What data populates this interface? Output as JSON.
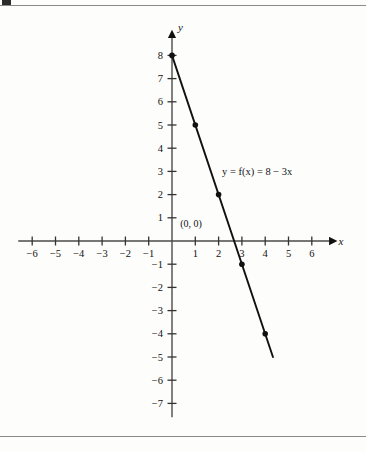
{
  "page": {
    "top_rule": true,
    "bottom_rule": true,
    "background": "#fdfdfc",
    "ink_color": "#111111"
  },
  "chart_data": {
    "type": "line",
    "title": "",
    "xlabel": "x",
    "ylabel": "y",
    "equation_label": "y = f(x) = 8 − 3x",
    "origin_label": "(0, 0)",
    "xlim": [
      -6.6,
      6.8
    ],
    "ylim": [
      -7.6,
      8.8
    ],
    "grid": false,
    "legend": "none",
    "x_ticks": [
      -6,
      -5,
      -4,
      -3,
      -2,
      -1,
      1,
      2,
      3,
      4,
      5,
      6
    ],
    "x_tick_labels": [
      "−6",
      "−5",
      "−4",
      "−3",
      "−2",
      "−1",
      "1",
      "2",
      "3",
      "4",
      "5",
      "6"
    ],
    "y_ticks": [
      8,
      7,
      6,
      5,
      4,
      3,
      2,
      1,
      -1,
      -2,
      -3,
      -4,
      -5,
      -6,
      -7
    ],
    "y_tick_labels": [
      "8",
      "7",
      "6",
      "5",
      "4",
      "3",
      "2",
      "1",
      "−1",
      "−2",
      "−3",
      "−4",
      "−5",
      "−6",
      "−7"
    ],
    "series": [
      {
        "name": "f(x) = 8 - 3x",
        "line_from": [
          0,
          8
        ],
        "line_to": [
          4.333,
          -5
        ],
        "points": [
          {
            "x": 0,
            "y": 8
          },
          {
            "x": 1,
            "y": 5
          },
          {
            "x": 2,
            "y": 2
          },
          {
            "x": 3,
            "y": -1
          },
          {
            "x": 4,
            "y": -4
          }
        ]
      }
    ],
    "axis_arrows": [
      "x-positive",
      "y-positive"
    ],
    "line_color": "#111111",
    "point_color": "#111111"
  }
}
